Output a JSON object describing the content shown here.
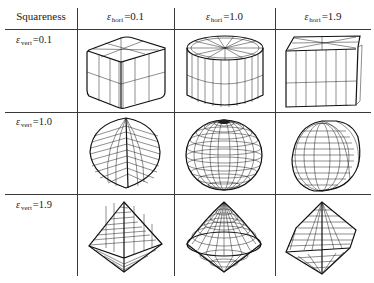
{
  "table": {
    "corner_header": "Squareness",
    "epsilon_symbol": "ε",
    "col_headers": [
      {
        "sub": "hori",
        "value": "=0.1"
      },
      {
        "sub": "hori",
        "value": "=1.0"
      },
      {
        "sub": "hori",
        "value": "=1.9"
      }
    ],
    "row_headers": [
      {
        "sub": "vert",
        "value": "=0.1"
      },
      {
        "sub": "vert",
        "value": "=1.0"
      },
      {
        "sub": "vert",
        "value": "=1.9"
      }
    ],
    "cells": [
      [
        "superquadric wireframe: rounded box",
        "superquadric wireframe: cylinder",
        "superquadric wireframe: box with flat top"
      ],
      [
        "superquadric wireframe: faceted bulb",
        "superquadric wireframe: sphere",
        "superquadric wireframe: skewed rounded ellipsoid"
      ],
      [
        "superquadric wireframe: octahedron",
        "superquadric wireframe: double cone",
        "superquadric wireframe: faceted octahedron"
      ]
    ]
  }
}
